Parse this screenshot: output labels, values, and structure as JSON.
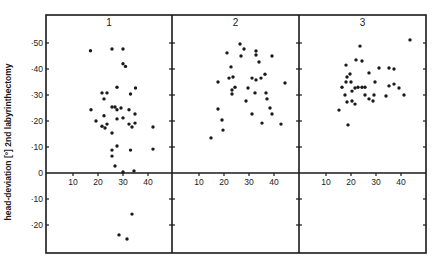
{
  "chart_data": {
    "type": "scatter",
    "title": "",
    "ylabel": "head-deviation [°] 2nd labyrinthectomy",
    "xlabel": "",
    "ylim": [
      -30,
      60
    ],
    "xlim": [
      0,
      48
    ],
    "yticks": [
      50,
      40,
      30,
      20,
      10,
      0,
      -10,
      -20
    ],
    "ytick_labels": [
      "·50",
      "·40",
      "·30",
      "·20",
      "·10",
      "0",
      "·10",
      "·20"
    ],
    "xticks": [
      10,
      20,
      30,
      40
    ],
    "xtick_labels": [
      "10",
      "20",
      "30",
      "40"
    ],
    "grid": false,
    "legend": "none",
    "colors": {
      "ink": "#1a1a1a",
      "background": "#ffffff"
    },
    "panels": [
      {
        "title": "1",
        "points": [
          [
            17,
            47
          ],
          [
            25.6,
            47.7
          ],
          [
            30,
            47.7
          ],
          [
            30,
            42
          ],
          [
            31,
            41
          ],
          [
            27.6,
            33
          ],
          [
            35,
            32.7
          ],
          [
            21.6,
            30.8
          ],
          [
            23.6,
            30.8
          ],
          [
            33,
            30.4
          ],
          [
            22.4,
            28.5
          ],
          [
            17.2,
            24.3
          ],
          [
            25.6,
            25.4
          ],
          [
            26.8,
            25.4
          ],
          [
            27.6,
            24.3
          ],
          [
            29.2,
            25
          ],
          [
            32.4,
            24.3
          ],
          [
            34.8,
            22.7
          ],
          [
            22.4,
            22
          ],
          [
            27.6,
            20.8
          ],
          [
            30,
            21.2
          ],
          [
            19.2,
            20
          ],
          [
            21.6,
            18
          ],
          [
            22.8,
            17.3
          ],
          [
            23.6,
            18.8
          ],
          [
            32.4,
            18.8
          ],
          [
            33.6,
            17.7
          ],
          [
            34.8,
            19.2
          ],
          [
            42,
            17.7
          ],
          [
            25.6,
            15.4
          ],
          [
            27.6,
            10.4
          ],
          [
            25.6,
            8.8
          ],
          [
            25.6,
            6.5
          ],
          [
            26.8,
            2.7
          ],
          [
            33,
            8.8
          ],
          [
            42,
            9.2
          ],
          [
            30,
            0.4
          ],
          [
            34.4,
            0.8
          ],
          [
            33.6,
            -15.8
          ],
          [
            28.4,
            -23.8
          ],
          [
            31.6,
            -25.4
          ]
        ]
      },
      {
        "title": "2",
        "points": [
          [
            26.4,
            49.6
          ],
          [
            28,
            47.7
          ],
          [
            21.2,
            46.2
          ],
          [
            32.8,
            46.9
          ],
          [
            32.8,
            45.4
          ],
          [
            26.8,
            45
          ],
          [
            39.2,
            45
          ],
          [
            34,
            42.7
          ],
          [
            22.8,
            40.8
          ],
          [
            17.6,
            35
          ],
          [
            22,
            36.5
          ],
          [
            23.6,
            36.9
          ],
          [
            31.2,
            36.5
          ],
          [
            32.8,
            35.8
          ],
          [
            34.8,
            36.5
          ],
          [
            36.4,
            38
          ],
          [
            44.4,
            34.6
          ],
          [
            29.6,
            32.7
          ],
          [
            24.4,
            33
          ],
          [
            23.2,
            31.9
          ],
          [
            23.2,
            30.4
          ],
          [
            32.4,
            30.8
          ],
          [
            36.8,
            30.8
          ],
          [
            37.2,
            28.5
          ],
          [
            28.8,
            27.7
          ],
          [
            38.4,
            25
          ],
          [
            39.2,
            22.7
          ],
          [
            17.6,
            24.6
          ],
          [
            31.2,
            22.7
          ],
          [
            19.2,
            20.4
          ],
          [
            35.2,
            19.2
          ],
          [
            42.8,
            18.8
          ],
          [
            19.6,
            16.5
          ],
          [
            14.8,
            13.5
          ]
        ]
      },
      {
        "title": "3",
        "points": [
          [
            43.6,
            51.2
          ],
          [
            23.6,
            48.8
          ],
          [
            22,
            43.5
          ],
          [
            24.4,
            43.1
          ],
          [
            18,
            41.5
          ],
          [
            31.2,
            40.4
          ],
          [
            35.2,
            40.4
          ],
          [
            37.2,
            40
          ],
          [
            27.2,
            38.5
          ],
          [
            19.6,
            38.1
          ],
          [
            18.4,
            36.9
          ],
          [
            18,
            35
          ],
          [
            20,
            35
          ],
          [
            29.6,
            35
          ],
          [
            37.2,
            34.2
          ],
          [
            35.2,
            33.5
          ],
          [
            16.4,
            33
          ],
          [
            39.2,
            32.7
          ],
          [
            21.6,
            32.7
          ],
          [
            22.8,
            33
          ],
          [
            24.4,
            33
          ],
          [
            25.6,
            33
          ],
          [
            20.4,
            31.5
          ],
          [
            41.2,
            30
          ],
          [
            17.6,
            30
          ],
          [
            25.6,
            30
          ],
          [
            29.2,
            30
          ],
          [
            34,
            29.6
          ],
          [
            27.2,
            28.5
          ],
          [
            28.8,
            27.7
          ],
          [
            18.4,
            27.3
          ],
          [
            20.4,
            27.7
          ],
          [
            21.6,
            26.5
          ],
          [
            15.2,
            24.2
          ],
          [
            18.8,
            18.5
          ]
        ]
      }
    ]
  }
}
